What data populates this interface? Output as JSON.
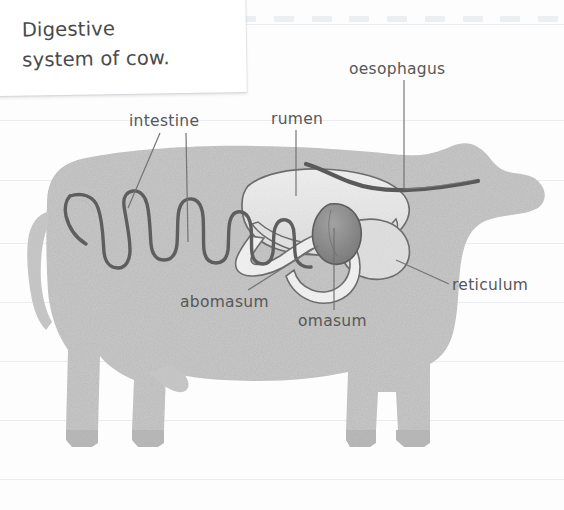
{
  "note": {
    "title_line1": "Digestive",
    "title_line2": "system of cow.",
    "title": "Digestive\nsystem of cow."
  },
  "diagram": {
    "labels": [
      {
        "key": "intestine",
        "text": "intestine"
      },
      {
        "key": "rumen",
        "text": "rumen"
      },
      {
        "key": "oesophagus",
        "text": "oesophagus"
      },
      {
        "key": "reticulum",
        "text": "reticulum"
      },
      {
        "key": "abomasum",
        "text": "abomasum"
      },
      {
        "key": "omasum",
        "text": "omasum"
      }
    ]
  },
  "colors": {
    "page_background": "#fdfdfd",
    "rule_line": "#e3e6ea",
    "note_background": "#ffffff",
    "text": "#575757",
    "note_text": "#4a4a4a",
    "cow_body": "#c8c8c8",
    "rumen": "#ebebeb",
    "reticulum": "#e0e0e0",
    "omasum": "#8a8a8a",
    "abomasum": "#f2f2f2",
    "organ_outline": "#6b6b6b",
    "intestine_outline": "#5e5e5e",
    "leader_line": "#6f6f6f"
  }
}
